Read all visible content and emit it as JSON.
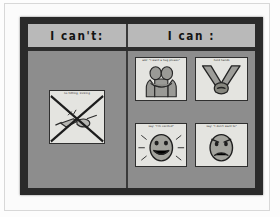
{
  "scene": {
    "subject": "classroom visual support communication board photograph",
    "board_background_color": "#8d8d8d",
    "frame_color": "#2a2a2a",
    "header_panel_color": "#b9b9b9",
    "card_color": "#e4e4e0",
    "ink_color": "#1b1b1b"
  },
  "board": {
    "columns": [
      {
        "id": "cant",
        "header": "I can't:"
      },
      {
        "id": "can",
        "header": "I can :"
      }
    ]
  },
  "cant_column": {
    "cards": [
      {
        "caption": "no hitting, kicking",
        "icon": "crossed-out-hitting-icon",
        "crossed_out": true
      }
    ]
  },
  "can_column": {
    "cards": [
      {
        "caption": "ask: \"I want a hug please\"",
        "icon": "two-people-hugging-icon"
      },
      {
        "caption": "hold hands",
        "icon": "two-hands-clasped-icon"
      },
      {
        "caption": "say: \"I'm excited\"",
        "icon": "happy-face-icon"
      },
      {
        "caption": "say: \"I don't want to\"",
        "icon": "angry-face-icon"
      }
    ]
  }
}
